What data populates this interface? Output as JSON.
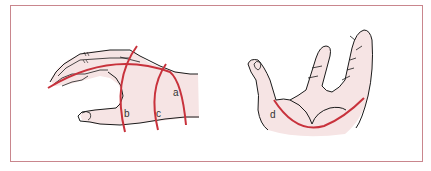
{
  "figure": {
    "border_color": "#c9868d",
    "skin_color": "#f6e4e4",
    "outline_color": "#1a1a1a",
    "line_color": "#c8323c",
    "panels": [
      {
        "name": "lateral-hand-view",
        "labels": [
          {
            "id": "a",
            "text": "a"
          },
          {
            "id": "b",
            "text": "b"
          },
          {
            "id": "c",
            "text": "c"
          }
        ]
      },
      {
        "name": "palm-view",
        "labels": [
          {
            "id": "d",
            "text": "d"
          }
        ]
      }
    ]
  }
}
